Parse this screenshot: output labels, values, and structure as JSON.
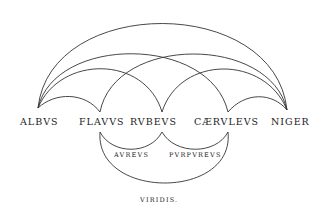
{
  "diagram": {
    "type": "color-relation arc diagram",
    "primary_colors": [
      {
        "id": "albus",
        "label": "ALBVS",
        "x": 38,
        "y": 108
      },
      {
        "id": "flavus",
        "label": "FLAVVS",
        "x": 100,
        "y": 112
      },
      {
        "id": "rubeus",
        "label": "RVBEVS",
        "x": 162,
        "y": 112
      },
      {
        "id": "caeruleus",
        "label": "CÆRVLEVS",
        "x": 228,
        "y": 112
      },
      {
        "id": "niger",
        "label": "NIGER",
        "x": 287,
        "y": 110
      }
    ],
    "upper_arcs": [
      {
        "from": "albus",
        "to": "niger",
        "apex_y": 18
      },
      {
        "from": "albus",
        "to": "caeruleus",
        "apex_y": 50
      },
      {
        "from": "flavus",
        "to": "niger",
        "apex_y": 50
      },
      {
        "from": "albus",
        "to": "rubeus",
        "apex_y": 78
      },
      {
        "from": "rubeus",
        "to": "niger",
        "apex_y": 78
      },
      {
        "from": "albus",
        "to": "flavus",
        "apex_y": 100
      },
      {
        "from": "caeruleus",
        "to": "niger",
        "apex_y": 100
      }
    ],
    "lower_arcs": [
      {
        "from": "flavus",
        "to": "rubeus",
        "apex_y": 145,
        "mix_label": "AVREVS"
      },
      {
        "from": "rubeus",
        "to": "caeruleus",
        "apex_y": 145,
        "mix_label": "PVRPVREVS"
      },
      {
        "from": "flavus",
        "to": "caeruleus",
        "apex_y": 186,
        "mix_label": "VIRIDIS."
      }
    ],
    "labels": {
      "albus": "ALBVS",
      "flavus": "FLAVVS",
      "rubeus": "RVBEVS",
      "caeruleus": "CÆRVLEVS",
      "niger": "NIGER",
      "aureus": "AVREVS",
      "purpureus": "PVRPVREVS",
      "viridis": "VIRIDIS."
    },
    "stroke_color": "#333333",
    "text_color": "#222222",
    "background": "#ffffff"
  }
}
